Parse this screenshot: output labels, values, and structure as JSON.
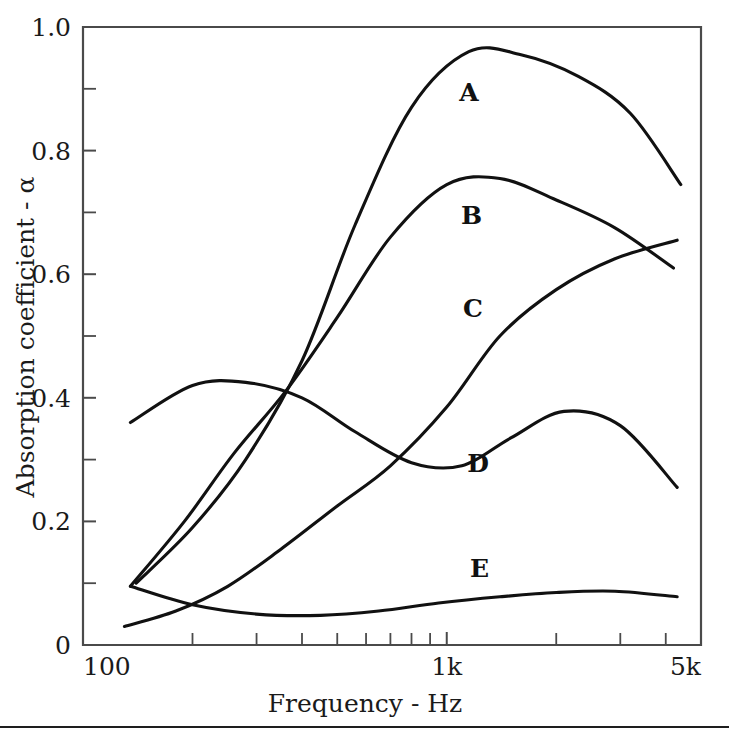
{
  "chart_data": {
    "type": "line",
    "title": "",
    "xlabel": "Frequency - Hz",
    "ylabel": "Absorption coefficient - α",
    "xscale": "log",
    "xlim": [
      100,
      5000
    ],
    "ylim": [
      0,
      1.0
    ],
    "grid": false,
    "legend": "inline-curve-labels",
    "x_tick_labels": [
      {
        "value": 100,
        "label": "100"
      },
      {
        "value": 1000,
        "label": "1k"
      },
      {
        "value": 5000,
        "label": "5k"
      }
    ],
    "x_minor_ticks": [
      200,
      300,
      400,
      500,
      600,
      700,
      800,
      900,
      2000,
      3000,
      4000
    ],
    "y_tick_labels": [
      {
        "value": 0,
        "label": "0"
      },
      {
        "value": 0.2,
        "label": "0.2"
      },
      {
        "value": 0.4,
        "label": "0.4"
      },
      {
        "value": 0.6,
        "label": "0.6"
      },
      {
        "value": 0.8,
        "label": "0.8"
      },
      {
        "value": 1.0,
        "label": "1.0"
      }
    ],
    "y_minor_ticks": [
      0.1,
      0.3,
      0.5,
      0.7,
      0.9
    ],
    "series": [
      {
        "name": "A",
        "label": "A",
        "label_at": {
          "x": 1150,
          "y": 0.895
        },
        "x": [
          140,
          200,
          280,
          400,
          560,
          800,
          1150,
          1600,
          2300,
          3200,
          4400
        ],
        "values": [
          0.1,
          0.19,
          0.3,
          0.46,
          0.68,
          0.87,
          0.96,
          0.955,
          0.92,
          0.86,
          0.745
        ]
      },
      {
        "name": "B",
        "label": "B",
        "label_at": {
          "x": 1170,
          "y": 0.695
        },
        "x": [
          135,
          190,
          260,
          360,
          500,
          700,
          1000,
          1400,
          2000,
          2900,
          4200
        ],
        "values": [
          0.095,
          0.2,
          0.31,
          0.41,
          0.53,
          0.66,
          0.745,
          0.755,
          0.72,
          0.675,
          0.61
        ]
      },
      {
        "name": "C",
        "label": "C",
        "label_at": {
          "x": 1180,
          "y": 0.545
        },
        "x": [
          130,
          180,
          250,
          350,
          500,
          700,
          1000,
          1400,
          2000,
          2900,
          4300
        ],
        "values": [
          0.03,
          0.055,
          0.095,
          0.155,
          0.225,
          0.29,
          0.385,
          0.5,
          0.575,
          0.625,
          0.655
        ]
      },
      {
        "name": "D",
        "label": "D",
        "label_at": {
          "x": 1220,
          "y": 0.295
        },
        "x": [
          135,
          200,
          280,
          400,
          560,
          800,
          1100,
          1500,
          2100,
          3000,
          4300
        ],
        "values": [
          0.36,
          0.42,
          0.425,
          0.4,
          0.345,
          0.295,
          0.29,
          0.335,
          0.378,
          0.355,
          0.255
        ]
      },
      {
        "name": "E",
        "label": "E",
        "label_at": {
          "x": 1230,
          "y": 0.125
        },
        "x": [
          135,
          200,
          300,
          450,
          650,
          950,
          1400,
          2000,
          2900,
          4300
        ],
        "values": [
          0.095,
          0.065,
          0.05,
          0.048,
          0.055,
          0.068,
          0.078,
          0.085,
          0.087,
          0.078
        ]
      }
    ]
  }
}
